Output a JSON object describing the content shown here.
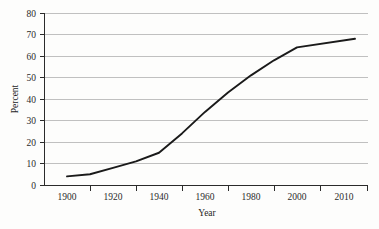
{
  "chart_data": {
    "type": "line",
    "title": "",
    "subtitle": "",
    "xlabel": "Year",
    "ylabel": "Percent",
    "x": [
      1900,
      1910,
      1920,
      1930,
      1940,
      1950,
      1960,
      1970,
      1980,
      1990,
      2000,
      2010
    ],
    "values": [
      4,
      5,
      8,
      11,
      15,
      24,
      34,
      43,
      51,
      58,
      64,
      68
    ],
    "series": [
      {
        "name": "Percent",
        "values": [
          4,
          5,
          8,
          11,
          15,
          24,
          34,
          43,
          51,
          58,
          64,
          68
        ],
        "color": "#1a1a1a"
      }
    ],
    "xtick_labels": [
      "1900",
      "1920",
      "1940",
      "1960",
      "1980",
      "2000",
      "2010"
    ],
    "xtick_values": [
      1900,
      1920,
      1940,
      1960,
      1980,
      2000,
      2010
    ],
    "ytick_labels": [
      "0",
      "10",
      "20",
      "30",
      "40",
      "50",
      "60",
      "70",
      "80"
    ],
    "ytick_values": [
      0,
      10,
      20,
      30,
      40,
      50,
      60,
      70,
      80
    ],
    "ylim": [
      0,
      80
    ],
    "grid": "horizontal",
    "legend": "none",
    "annotations": []
  },
  "axes": {
    "y_title": "Percent",
    "x_title": "Year",
    "y_ticks": {
      "t0": "0",
      "t1": "10",
      "t2": "20",
      "t3": "30",
      "t4": "40",
      "t5": "50",
      "t6": "60",
      "t7": "70",
      "t8": "80"
    },
    "x_ticks": {
      "t0": "1900",
      "t1": "1920",
      "t2": "1940",
      "t3": "1960",
      "t4": "1980",
      "t5": "2000",
      "t6": "2010"
    }
  },
  "style": {
    "line_color": "#1a1a1a",
    "gridline_color": "#b0b0b0",
    "axis_color": "#2b2b2b",
    "background_color": "#fdfdfc"
  }
}
